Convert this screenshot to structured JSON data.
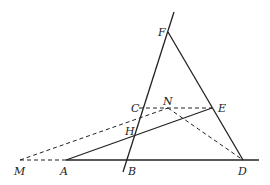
{
  "diagram": {
    "type": "geometry",
    "points": {
      "M": {
        "label": "M",
        "x": 20,
        "y": 160
      },
      "A": {
        "label": "A",
        "x": 66,
        "y": 160
      },
      "B": {
        "label": "B",
        "x": 127,
        "y": 160
      },
      "D": {
        "label": "D",
        "x": 243,
        "y": 160
      },
      "C": {
        "label": "C",
        "x": 139,
        "y": 108
      },
      "H": {
        "label": "H",
        "x": 134,
        "y": 135
      },
      "N": {
        "label": "N",
        "x": 168,
        "y": 108
      },
      "E": {
        "label": "E",
        "x": 212,
        "y": 108
      },
      "F": {
        "label": "F",
        "x": 168,
        "y": 32
      }
    },
    "labels": {
      "M": "M",
      "A": "A",
      "B": "B",
      "D": "D",
      "C": "C",
      "H": "H",
      "N": "N",
      "E": "E",
      "F": "F"
    },
    "solid_segments": [
      [
        "A",
        "line-end-right"
      ],
      [
        "line-bottom-B",
        "line-top-F"
      ],
      [
        "F",
        "D"
      ],
      [
        "A",
        "E"
      ]
    ],
    "dashed_segments": [
      [
        "M",
        "A"
      ],
      [
        "M",
        "N"
      ],
      [
        "C",
        "E"
      ],
      [
        "N",
        "D"
      ]
    ]
  }
}
